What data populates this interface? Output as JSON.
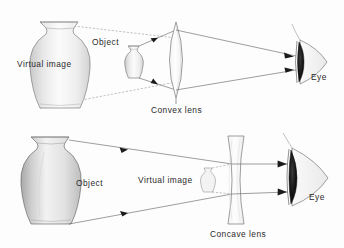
{
  "figure": {
    "background_color": "#fdfdfd",
    "ink_color": "#2b2b2b",
    "ray_color": "#5d5d5d",
    "iris_color": "#111111"
  },
  "panels": [
    {
      "id": "convex-panel",
      "lens_type": "convex",
      "lens_label": "Convex lens",
      "object_label": "Object",
      "image_label": "Virtual image",
      "eye_label": "Eye",
      "image_is_magnified": true,
      "description": "A convex lens used as a magnifier: the small object placed inside the focal length produces a large, upright virtual image on the same side as the object."
    },
    {
      "id": "concave-panel",
      "lens_type": "concave",
      "lens_label": "Concave lens",
      "object_label": "Object",
      "image_label": "Virtual image",
      "eye_label": "Eye",
      "image_is_magnified": false,
      "description": "A concave lens: the large object produces a small, upright virtual image located between the lens and the object."
    }
  ],
  "labels": {
    "top_virtual_image": "Virtual image",
    "top_object": "Object",
    "top_lens": "Convex lens",
    "top_eye": "Eye",
    "bottom_object": "Object",
    "bottom_virtual_image": "Virtual image",
    "bottom_lens": "Concave lens",
    "bottom_eye": "Eye"
  },
  "icons": {
    "vase": "vase-icon",
    "lens_convex": "convex-lens-icon",
    "lens_concave": "concave-lens-icon",
    "eye": "eye-icon",
    "ray_arrow": "ray-arrow-icon"
  }
}
